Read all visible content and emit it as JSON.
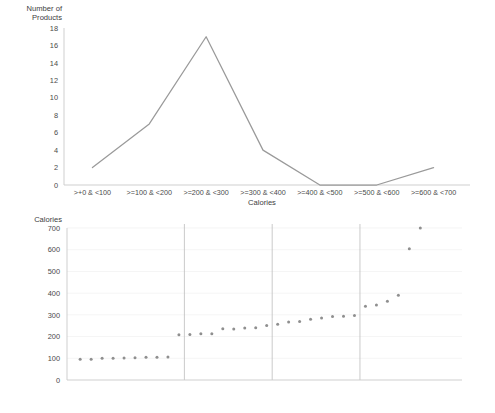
{
  "chart_data": [
    {
      "type": "line",
      "title": "",
      "xlabel": "Calories",
      "ylabel": "Number of Products",
      "categories": [
        ">+0 & <100",
        ">=100 & <200",
        ">=200 & <300",
        ">=300 & <400",
        ">=400 & <500",
        ">=500 & <600",
        ">=600 & <700"
      ],
      "values": [
        2,
        7,
        17,
        4,
        0,
        0,
        2
      ],
      "ylim": [
        0,
        18
      ],
      "yticks": [
        0,
        2,
        4,
        6,
        8,
        10,
        12,
        14,
        16,
        18
      ],
      "grid": false,
      "legend": "none",
      "line_color": "#9a9a9a"
    },
    {
      "type": "scatter",
      "title": "",
      "xlabel": "",
      "ylabel": "Calories",
      "ylim": [
        0,
        700
      ],
      "yticks": [
        0,
        100,
        200,
        300,
        400,
        500,
        600,
        700
      ],
      "grid": true,
      "legend": "none",
      "point_color": "#8f8f8f",
      "x": [
        1,
        2,
        3,
        4,
        5,
        6,
        7,
        8,
        9,
        10,
        11,
        12,
        13,
        14,
        15,
        16,
        17,
        18,
        19,
        20,
        21,
        22,
        23,
        24,
        25,
        26,
        27,
        28,
        29,
        30,
        31,
        32,
        33,
        34,
        35,
        36
      ],
      "values": [
        95,
        96,
        100,
        100,
        101,
        103,
        105,
        105,
        106,
        208,
        209,
        213,
        213,
        236,
        235,
        240,
        241,
        251,
        257,
        267,
        269,
        280,
        286,
        292,
        294,
        297,
        340,
        345,
        363,
        390,
        605,
        700
      ],
      "dividers": [
        9.5,
        17.5,
        25.5
      ],
      "divider_color": "#bdbdbd"
    }
  ],
  "line_chart": {
    "y_axis_title": "Number of Products",
    "x_axis_title": "Calories"
  },
  "scatter_chart": {
    "y_axis_title": "Calories"
  }
}
